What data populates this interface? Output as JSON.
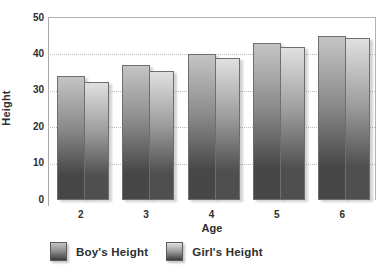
{
  "chart_data": {
    "type": "bar",
    "title": "",
    "xlabel": "Age",
    "ylabel": "Height",
    "categories": [
      "2",
      "3",
      "4",
      "5",
      "6"
    ],
    "series": [
      {
        "name": "Boy's Height",
        "values": [
          34,
          37,
          40,
          43,
          45
        ],
        "gradient_top": "#c4c4c4",
        "gradient_mid": "#8a8a8a",
        "gradient_bottom": "#474747"
      },
      {
        "name": "Girl's Height",
        "values": [
          32.5,
          35.5,
          39,
          42,
          44.5
        ],
        "gradient_top": "#e0e0e0",
        "gradient_mid": "#9c9c9c",
        "gradient_bottom": "#4f4f4f"
      }
    ],
    "ylim": [
      0,
      50
    ],
    "yticks": [
      0,
      10,
      20,
      30,
      40,
      50
    ],
    "grid": "horizontal-dotted",
    "legend_position": "bottom"
  },
  "colors": {
    "text": "#2e2e2e",
    "axis_line": "#a8a8a8",
    "plot_border": "#b2b2b2",
    "gridline": "#bdbdbd",
    "bar_border": "#6e6e6e"
  }
}
